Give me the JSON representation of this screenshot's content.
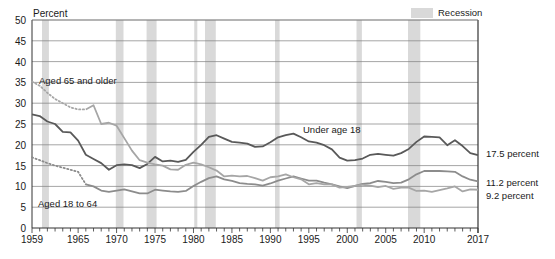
{
  "axis": {
    "y_title": "Percent",
    "y_ticks": [
      "0",
      "5",
      "10",
      "15",
      "20",
      "25",
      "30",
      "35",
      "40",
      "45",
      "50"
    ],
    "x_ticks": [
      "1959",
      "1965",
      "1970",
      "1975",
      "1980",
      "1985",
      "1990",
      "1995",
      "2000",
      "2005",
      "2010",
      "2017"
    ]
  },
  "legend": {
    "recession_label": "Recession",
    "recession_color": "#d9d9d9"
  },
  "series_labels": {
    "elderly": "Aged 65 and older",
    "children": "Under age 18",
    "adults": "Aged 18 to 64"
  },
  "end_labels": {
    "children": "17.5 percent",
    "adults": "11.2 percent",
    "elderly": "9.2 percent"
  },
  "chart_data": {
    "type": "line",
    "title": "",
    "xlabel": "",
    "ylabel": "Percent",
    "ylim": [
      0,
      50
    ],
    "xlim": [
      1959,
      2017
    ],
    "grid": true,
    "legend_position": "top-right",
    "y_tick_values": [
      0,
      5,
      10,
      15,
      20,
      25,
      30,
      35,
      40,
      45,
      50
    ],
    "x_tick_values": [
      1959,
      1965,
      1970,
      1975,
      1980,
      1985,
      1990,
      1995,
      2000,
      2005,
      2010,
      2017
    ],
    "x": [
      1959,
      1960,
      1961,
      1962,
      1963,
      1964,
      1965,
      1966,
      1967,
      1968,
      1969,
      1970,
      1971,
      1972,
      1973,
      1974,
      1975,
      1976,
      1977,
      1978,
      1979,
      1980,
      1981,
      1982,
      1983,
      1984,
      1985,
      1986,
      1987,
      1988,
      1989,
      1990,
      1991,
      1992,
      1993,
      1994,
      1995,
      1996,
      1997,
      1998,
      1999,
      2000,
      2001,
      2002,
      2003,
      2004,
      2005,
      2006,
      2007,
      2008,
      2009,
      2010,
      2011,
      2012,
      2013,
      2014,
      2015,
      2016,
      2017
    ],
    "series": [
      {
        "name": "Under age 18",
        "color": "#595959",
        "style": "solid",
        "end_value": 17.5,
        "values": [
          27.3,
          26.9,
          25.6,
          25.0,
          23.1,
          23.0,
          21.0,
          17.6,
          16.6,
          15.6,
          14.0,
          15.1,
          15.3,
          15.1,
          14.4,
          15.4,
          17.1,
          16.0,
          16.2,
          15.9,
          16.4,
          18.3,
          20.0,
          21.9,
          22.3,
          21.5,
          20.7,
          20.5,
          20.3,
          19.5,
          19.6,
          20.6,
          21.8,
          22.3,
          22.7,
          21.8,
          20.8,
          20.5,
          19.9,
          18.9,
          16.9,
          16.2,
          16.3,
          16.7,
          17.6,
          17.8,
          17.6,
          17.4,
          18.0,
          19.0,
          20.7,
          22.0,
          21.9,
          21.8,
          19.9,
          21.1,
          19.7,
          18.0,
          17.5
        ]
      },
      {
        "name": "Aged 18 to 64",
        "color": "#8c8c8c",
        "style": "dotted-then-solid",
        "dotted_until": 1966,
        "end_value": 11.2,
        "values": [
          17.0,
          16.3,
          15.6,
          15.0,
          14.5,
          14.0,
          13.5,
          10.5,
          10.0,
          9.0,
          8.7,
          9.0,
          9.3,
          8.8,
          8.3,
          8.3,
          9.2,
          9.0,
          8.8,
          8.7,
          8.9,
          10.1,
          11.1,
          12.0,
          12.4,
          11.7,
          11.3,
          10.8,
          10.6,
          10.5,
          10.2,
          10.7,
          11.4,
          11.9,
          12.4,
          11.9,
          11.4,
          11.4,
          10.9,
          10.5,
          10.0,
          9.6,
          10.1,
          10.6,
          10.8,
          11.3,
          11.1,
          10.8,
          10.9,
          11.7,
          12.9,
          13.7,
          13.7,
          13.7,
          13.6,
          13.5,
          12.4,
          11.6,
          11.2
        ]
      },
      {
        "name": "Aged 65 and older",
        "color": "#a6a6a6",
        "style": "dotted-then-solid",
        "dotted_until": 1966,
        "end_value": 9.2,
        "values": [
          35.2,
          34.2,
          32.5,
          31.0,
          30.0,
          29.0,
          28.5,
          28.5,
          29.5,
          25.0,
          25.3,
          24.6,
          21.6,
          18.6,
          16.3,
          15.7,
          15.3,
          15.0,
          14.1,
          14.0,
          15.2,
          15.7,
          15.3,
          14.6,
          13.8,
          12.4,
          12.6,
          12.4,
          12.5,
          12.0,
          11.4,
          12.2,
          12.4,
          12.9,
          12.2,
          11.7,
          10.5,
          10.8,
          10.5,
          10.5,
          9.7,
          9.9,
          10.1,
          10.4,
          10.2,
          9.8,
          10.1,
          9.4,
          9.7,
          9.7,
          8.9,
          9.0,
          8.7,
          9.1,
          9.5,
          10.0,
          8.8,
          9.3,
          9.2
        ]
      }
    ],
    "recessions": [
      {
        "start": 1960.3,
        "end": 1961.2
      },
      {
        "start": 1969.9,
        "end": 1970.9
      },
      {
        "start": 1973.9,
        "end": 1975.2
      },
      {
        "start": 1980.1,
        "end": 1980.5
      },
      {
        "start": 1981.5,
        "end": 1982.9
      },
      {
        "start": 1990.6,
        "end": 1991.2
      },
      {
        "start": 2001.2,
        "end": 2001.9
      },
      {
        "start": 2007.9,
        "end": 2009.5
      }
    ]
  }
}
